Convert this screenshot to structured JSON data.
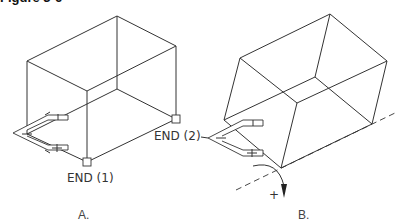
{
  "figure": {
    "title_fragment": "Figure 3-6",
    "panels": [
      {
        "id": "A",
        "label": "A.",
        "snap_labels": [
          "END (1)",
          "END (2)"
        ]
      },
      {
        "id": "B",
        "label": "B.",
        "rotation_sign": "+"
      }
    ]
  },
  "colors": {
    "line": "#333333",
    "background": "#ffffff"
  }
}
